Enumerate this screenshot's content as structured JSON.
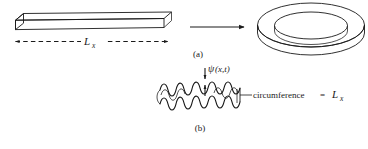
{
  "figure": {
    "kind": "physics-diagram",
    "background_color": "#ffffff",
    "line_color": "#1a1a1a",
    "fill_color": "#ffffff",
    "shade_color": "#f2f2f2"
  },
  "panel_a": {
    "caption": "(a)",
    "bar": {
      "name": "rectangular-bar",
      "length_label_base": "L",
      "length_label_sub": "x"
    },
    "transform_arrow": {
      "name": "transform-arrow",
      "direction": "right",
      "style": "solid"
    },
    "ring": {
      "name": "torus-ring",
      "style": "annular-cylinder"
    },
    "dimension_arrow": {
      "name": "length-dimension-arrow",
      "style": "dashed-double-headed"
    }
  },
  "panel_b": {
    "caption": "(b)",
    "wave_ring": {
      "name": "wavy-ring",
      "cycles": 7
    },
    "amplitude_label": {
      "base": "ψ",
      "args": "(x,t)"
    },
    "circumference_label": {
      "text": "circumference",
      "equals": "=",
      "value_base": "L",
      "value_sub": "x"
    }
  }
}
